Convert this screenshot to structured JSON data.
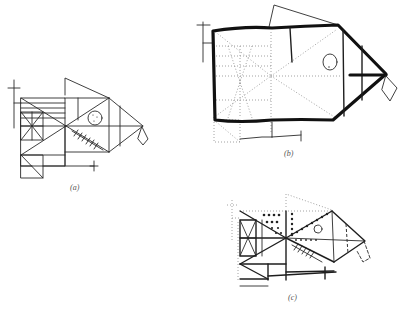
{
  "figure": {
    "panels": [
      {
        "id": "a",
        "label": "(a)",
        "style": "thin line drawing of geometric fish on grid"
      },
      {
        "id": "b",
        "label": "(b)",
        "style": "bold outline fish over dotted construction grid"
      },
      {
        "id": "c",
        "label": "(c)",
        "style": "mixed heavy lines with beaded dotted lines"
      }
    ]
  },
  "colors": {
    "background": "#ffffff",
    "ink": "#1e1e1e",
    "construction": "#8a8a8a",
    "label": "#555555"
  }
}
